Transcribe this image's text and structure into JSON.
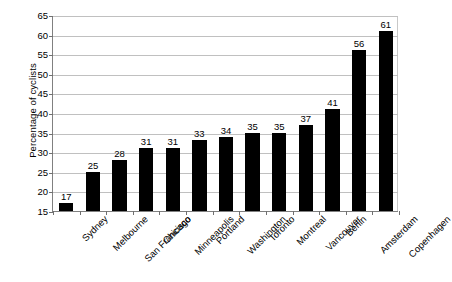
{
  "chart_data": {
    "type": "bar",
    "title": "",
    "subtitle": "",
    "xlabel": "",
    "ylabel": "Percentage of cyclists",
    "ylim": [
      15,
      65
    ],
    "ytick_step": 5,
    "yticks": [
      15,
      20,
      25,
      30,
      35,
      40,
      45,
      50,
      55,
      60,
      65
    ],
    "grid": true,
    "legend": false,
    "legend_position": "none",
    "bar_color": "#000000",
    "gridline_color": "#c0c0c0",
    "axis_color": "#808080",
    "background_color": "#ffffff",
    "xtick_label_rotation": -45,
    "categories": [
      "Sydney",
      "Melbourne",
      "San Francisco",
      "Chicago",
      "Minneapolis",
      "Portland",
      "Washington",
      "Toronto",
      "Montreal",
      "Vancouver",
      "Berlin",
      "Amsterdam",
      "Copenhagen"
    ],
    "values": [
      17,
      25,
      28,
      31,
      31,
      33,
      34,
      35,
      35,
      37,
      41,
      56,
      61
    ],
    "data_labels": [
      "17",
      "25",
      "28",
      "31",
      "31",
      "33",
      "34",
      "35",
      "35",
      "37",
      "41",
      "56",
      "61"
    ]
  }
}
